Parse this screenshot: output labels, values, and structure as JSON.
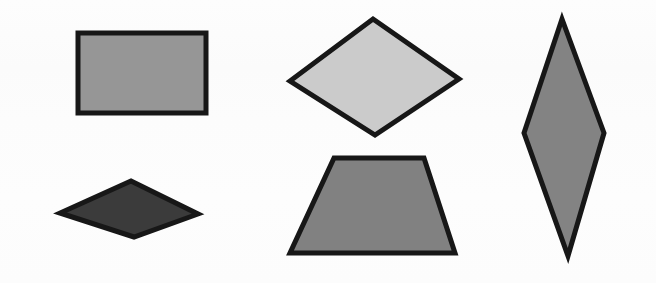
{
  "canvas": {
    "width": 656,
    "height": 283,
    "background_color": "#fcfcfc",
    "description": "Five outlined geometric quadrilaterals arranged on a plain near-white background"
  },
  "palette": {
    "outline_color": "#171717",
    "light_gray": "#cbcbcb",
    "mid_gray": "#969696",
    "medium_gray": "#818181",
    "steel_gray": "#838383",
    "dark_gray": "#3b3b3b",
    "background": "#fcfcfc"
  },
  "shapes": [
    {
      "id": "rectangle",
      "name": "rectangle",
      "label": "Rectangle",
      "fill_color": "#969696",
      "stroke_color": "#171717",
      "stroke_width": 5,
      "points": "78,33 206,33 206,113 78,113",
      "center": {
        "x": 142,
        "y": 73
      },
      "position": "top-left"
    },
    {
      "id": "kite-diamond",
      "name": "wide-diamond",
      "label": "Wide Diamond",
      "fill_color": "#cbcbcb",
      "stroke_color": "#171717",
      "stroke_width": 5,
      "points": "373,19 459,79 375,135 290,81",
      "center": {
        "x": 374,
        "y": 78
      },
      "position": "top-center"
    },
    {
      "id": "flat-rhombus",
      "name": "flat-rhombus",
      "label": "Flat Rhombus",
      "fill_color": "#3b3b3b",
      "stroke_color": "#171717",
      "stroke_width": 5,
      "points": "131,181 198,214 134,237 60,213",
      "center": {
        "x": 131,
        "y": 209
      },
      "position": "bottom-left"
    },
    {
      "id": "trapezoid",
      "name": "trapezoid",
      "label": "Trapezoid",
      "fill_color": "#818181",
      "stroke_color": "#171717",
      "stroke_width": 5,
      "points": "334,158 424,158 455,253 290,253",
      "center": {
        "x": 376,
        "y": 208
      },
      "position": "bottom-center"
    },
    {
      "id": "tall-rhombus",
      "name": "tall-rhombus",
      "label": "Tall Rhombus",
      "fill_color": "#838383",
      "stroke_color": "#171717",
      "stroke_width": 5,
      "points": "562,19 604,133 568,256 524,133",
      "center": {
        "x": 564,
        "y": 135
      },
      "position": "right"
    }
  ]
}
